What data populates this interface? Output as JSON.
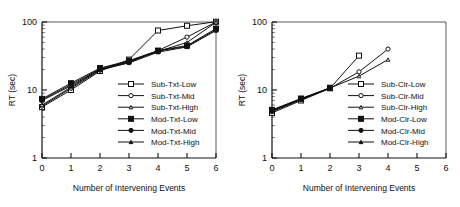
{
  "figure": {
    "panel_count": 2,
    "background": "#ffffff",
    "ink": "#111111"
  },
  "chart_data": [
    {
      "type": "line",
      "panel": "left",
      "title": "",
      "xlabel": "Number of Intervening Events",
      "ylabel": "RT (sec)",
      "xlim": [
        0,
        6
      ],
      "xticks": [
        0,
        1,
        2,
        3,
        4,
        5,
        6
      ],
      "xtick_labels": [
        "0",
        "1",
        "2",
        "3",
        "4",
        "5",
        "6"
      ],
      "yscale": "log",
      "ylim": [
        1,
        100
      ],
      "yticks": [
        1,
        10,
        100
      ],
      "ytick_labels": [
        "1",
        "10",
        "100"
      ],
      "grid": false,
      "legend_position": "center-right-inside",
      "series": [
        {
          "name": "Sub-Txt-Low",
          "marker": "square",
          "fill": "open",
          "marker_size": 5.0,
          "x": [
            0,
            1,
            2,
            3,
            4,
            5,
            6
          ],
          "values": [
            5.6,
            10.0,
            19.0,
            28.0,
            75.0,
            88.0,
            101.0
          ]
        },
        {
          "name": "Sub-Txt-Mid",
          "marker": "circle",
          "fill": "open",
          "marker_size": 4.2,
          "x": [
            0,
            1,
            2,
            3,
            4,
            5,
            6
          ],
          "values": [
            5.8,
            10.6,
            19.5,
            25.5,
            38.0,
            60.0,
            100.0
          ]
        },
        {
          "name": "Sub-Txt-High",
          "marker": "triangle",
          "fill": "open",
          "marker_size": 3.6,
          "x": [
            0,
            1,
            2,
            3,
            4,
            5,
            6
          ],
          "values": [
            6.0,
            11.0,
            20.0,
            26.0,
            37.0,
            50.0,
            99.0
          ]
        },
        {
          "name": "Mod-Txt-Low",
          "marker": "square",
          "fill": "filled",
          "marker_size": 5.0,
          "x": [
            0,
            1,
            2,
            3,
            4,
            5,
            6
          ],
          "values": [
            7.4,
            12.6,
            21.0,
            27.0,
            38.0,
            45.0,
            80.0
          ]
        },
        {
          "name": "Mod-Txt-Mid",
          "marker": "circle",
          "fill": "filled",
          "marker_size": 4.2,
          "x": [
            0,
            1,
            2,
            3,
            4,
            5,
            6
          ],
          "values": [
            7.2,
            12.0,
            20.5,
            26.5,
            37.5,
            44.0,
            77.0
          ]
        },
        {
          "name": "Mod-Txt-High",
          "marker": "triangle",
          "fill": "filled",
          "marker_size": 3.6,
          "x": [
            0,
            1,
            2,
            3,
            4,
            5,
            6
          ],
          "values": [
            7.0,
            11.5,
            20.0,
            25.0,
            36.0,
            43.0,
            75.0
          ]
        }
      ]
    },
    {
      "type": "line",
      "panel": "right",
      "title": "",
      "xlabel": "Number of Intervening Events",
      "ylabel": "RT (sec)",
      "xlim": [
        0,
        6
      ],
      "xticks": [
        0,
        1,
        2,
        3,
        4,
        5,
        6
      ],
      "xtick_labels": [
        "0",
        "1",
        "2",
        "3",
        "4",
        "5",
        "6"
      ],
      "yscale": "log",
      "ylim": [
        1,
        100
      ],
      "yticks": [
        1,
        10,
        100
      ],
      "ytick_labels": [
        "1",
        "10",
        "100"
      ],
      "grid": false,
      "legend_position": "center-right-inside",
      "series": [
        {
          "name": "Sub-Clr-Low",
          "marker": "square",
          "fill": "open",
          "marker_size": 5.0,
          "x": [
            0,
            1,
            2,
            3
          ],
          "values": [
            4.6,
            7.0,
            10.6,
            32.0
          ]
        },
        {
          "name": "Sub-Clr-Mid",
          "marker": "circle",
          "fill": "open",
          "marker_size": 4.2,
          "x": [
            0,
            1,
            2,
            3,
            4
          ],
          "values": [
            4.8,
            7.2,
            10.6,
            18.5,
            40.0
          ]
        },
        {
          "name": "Sub-Clr-High",
          "marker": "triangle",
          "fill": "open",
          "marker_size": 3.6,
          "x": [
            0,
            1,
            2,
            3,
            4
          ],
          "values": [
            4.9,
            7.3,
            10.7,
            16.0,
            28.0
          ]
        },
        {
          "name": "Mod-Clr-Low",
          "marker": "square",
          "fill": "filled",
          "marker_size": 5.0,
          "x": [
            0,
            1,
            2
          ],
          "values": [
            5.1,
            7.5,
            10.8
          ]
        },
        {
          "name": "Mod-Clr-Mid",
          "marker": "circle",
          "fill": "filled",
          "marker_size": 4.2,
          "x": [
            0,
            1,
            2
          ],
          "values": [
            5.0,
            7.4,
            10.7
          ]
        },
        {
          "name": "Mod-Clr-High",
          "marker": "triangle",
          "fill": "filled",
          "marker_size": 3.6,
          "x": [
            0,
            1,
            2
          ],
          "values": [
            4.9,
            7.3,
            10.6
          ]
        }
      ]
    }
  ]
}
